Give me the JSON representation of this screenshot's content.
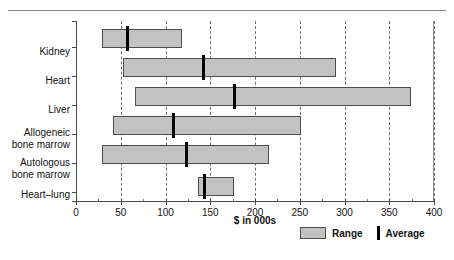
{
  "chart_data": {
    "type": "bar",
    "title": "",
    "subtitle": "",
    "xlabel": "$ in 000s",
    "ylabel": "",
    "xlim": [
      0,
      400
    ],
    "xticks": [
      0,
      50,
      100,
      150,
      200,
      250,
      300,
      350,
      400
    ],
    "xtick_labels": [
      "0",
      "50",
      "100",
      "150",
      "200",
      "250",
      "300",
      "350",
      "400"
    ],
    "minor_tick_step": 25,
    "grid": "vertical dashed at major ticks",
    "legend_position": "bottom-right",
    "legend": [
      {
        "key": "range",
        "label": "Range",
        "marker": "filled-gray-rectangle",
        "color": "#c2c2c2"
      },
      {
        "key": "average",
        "label": "Average",
        "marker": "vertical-black-bar",
        "color": "#000000"
      }
    ],
    "categories": [
      "Kidney",
      "Heart",
      "Liver",
      "Allogeneic bone marrow",
      "Autologous bone marrow",
      "Heart–lung"
    ],
    "series": [
      {
        "name": "Range",
        "type": "range",
        "values": [
          {
            "category": "Kidney",
            "low": 29,
            "high": 118
          },
          {
            "category": "Heart",
            "low": 53,
            "high": 290
          },
          {
            "category": "Liver",
            "low": 66,
            "high": 374
          },
          {
            "category": "Allogeneic bone marrow",
            "low": 41,
            "high": 251
          },
          {
            "category": "Autologous bone marrow",
            "low": 29,
            "high": 216
          },
          {
            "category": "Heart–lung",
            "low": 136,
            "high": 176
          }
        ]
      },
      {
        "name": "Average",
        "type": "marker",
        "values": [
          {
            "category": "Kidney",
            "value": 58
          },
          {
            "category": "Heart",
            "value": 143
          },
          {
            "category": "Liver",
            "value": 177
          },
          {
            "category": "Allogeneic bone marrow",
            "value": 109
          },
          {
            "category": "Autologous bone marrow",
            "value": 124
          },
          {
            "category": "Heart–lung",
            "value": 144
          }
        ]
      }
    ],
    "category_label_lines": [
      [
        "Kidney"
      ],
      [
        "Heart"
      ],
      [
        "Liver"
      ],
      [
        "Allogeneic",
        "bone marrow"
      ],
      [
        "Autologous",
        "bone marrow"
      ],
      [
        "Heart–lung"
      ]
    ]
  },
  "colors": {
    "range_fill": "#c2c2c2",
    "range_border": "#4e4e4e",
    "average": "#000000",
    "axis": "#4a4a4a",
    "grid": "#6f6f6f",
    "text": "#111111",
    "background": "#ffffff"
  }
}
